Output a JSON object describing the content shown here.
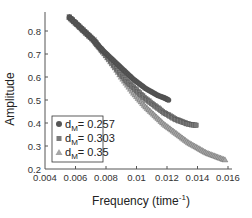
{
  "chart_data": {
    "type": "scatter",
    "title": "",
    "xlabel": "Frequency (time",
    "xlabel_sup": "-1",
    "xlabel_suffix": ")",
    "ylabel": "Amplitude",
    "xlim": [
      0.004,
      0.016
    ],
    "ylim": [
      0.2,
      0.88
    ],
    "x_ticks": [
      0.004,
      0.006,
      0.008,
      0.01,
      0.012,
      0.014,
      0.016
    ],
    "x_tick_labels": [
      "0.004",
      "0.006",
      "0.008",
      "0.01",
      "0.012",
      "0.014",
      "0.016"
    ],
    "y_ticks": [
      0.2,
      0.3,
      0.4,
      0.5,
      0.6,
      0.7,
      0.8
    ],
    "y_tick_labels": [
      "0.2",
      "0.3",
      "0.4",
      "0.5",
      "0.6",
      "0.7",
      "0.8"
    ],
    "grid": false,
    "legend_position": "lower left",
    "series": [
      {
        "name": "d_M = 0.257",
        "label_prefix": "d",
        "label_sub": "M",
        "label_suffix": "= 0.257",
        "marker": "circle",
        "color": "#555555",
        "points": [
          [
            0.0056,
            0.86
          ],
          [
            0.006,
            0.835
          ],
          [
            0.0064,
            0.81
          ],
          [
            0.0068,
            0.785
          ],
          [
            0.0072,
            0.76
          ],
          [
            0.0075,
            0.735
          ],
          [
            0.0078,
            0.715
          ],
          [
            0.0082,
            0.69
          ],
          [
            0.0086,
            0.665
          ],
          [
            0.009,
            0.64
          ],
          [
            0.0094,
            0.615
          ],
          [
            0.0098,
            0.59
          ],
          [
            0.0102,
            0.57
          ],
          [
            0.0106,
            0.55
          ],
          [
            0.011,
            0.535
          ],
          [
            0.0114,
            0.52
          ],
          [
            0.0118,
            0.51
          ],
          [
            0.0121,
            0.5
          ]
        ]
      },
      {
        "name": "d_M = 0.303",
        "label_prefix": "d",
        "label_sub": "M",
        "label_suffix": "= 0.303",
        "marker": "square",
        "color": "#7a7a7a",
        "points": [
          [
            0.0056,
            0.86
          ],
          [
            0.006,
            0.835
          ],
          [
            0.0064,
            0.81
          ],
          [
            0.0068,
            0.785
          ],
          [
            0.0072,
            0.76
          ],
          [
            0.0075,
            0.735
          ],
          [
            0.0078,
            0.71
          ],
          [
            0.0082,
            0.68
          ],
          [
            0.0086,
            0.645
          ],
          [
            0.009,
            0.61
          ],
          [
            0.0094,
            0.58
          ],
          [
            0.0098,
            0.555
          ],
          [
            0.0102,
            0.53
          ],
          [
            0.0106,
            0.505
          ],
          [
            0.011,
            0.485
          ],
          [
            0.0114,
            0.465
          ],
          [
            0.0118,
            0.445
          ],
          [
            0.0122,
            0.43
          ],
          [
            0.0126,
            0.415
          ],
          [
            0.013,
            0.405
          ],
          [
            0.0134,
            0.395
          ],
          [
            0.0139,
            0.39
          ]
        ]
      },
      {
        "name": "d_M = 0.35",
        "label_prefix": "d",
        "label_sub": "M",
        "label_suffix": "= 0.35",
        "marker": "triangle",
        "color": "#a6a6a6",
        "points": [
          [
            0.0056,
            0.86
          ],
          [
            0.006,
            0.835
          ],
          [
            0.0064,
            0.81
          ],
          [
            0.0068,
            0.785
          ],
          [
            0.0072,
            0.76
          ],
          [
            0.0075,
            0.735
          ],
          [
            0.0078,
            0.71
          ],
          [
            0.0082,
            0.675
          ],
          [
            0.0086,
            0.64
          ],
          [
            0.009,
            0.6
          ],
          [
            0.0094,
            0.565
          ],
          [
            0.0098,
            0.53
          ],
          [
            0.0102,
            0.5
          ],
          [
            0.0106,
            0.47
          ],
          [
            0.011,
            0.445
          ],
          [
            0.0114,
            0.42
          ],
          [
            0.0118,
            0.395
          ],
          [
            0.0122,
            0.375
          ],
          [
            0.0126,
            0.355
          ],
          [
            0.013,
            0.335
          ],
          [
            0.0134,
            0.315
          ],
          [
            0.0138,
            0.3
          ],
          [
            0.0142,
            0.285
          ],
          [
            0.0146,
            0.27
          ],
          [
            0.015,
            0.26
          ],
          [
            0.0154,
            0.25
          ],
          [
            0.0158,
            0.24
          ]
        ]
      }
    ]
  }
}
